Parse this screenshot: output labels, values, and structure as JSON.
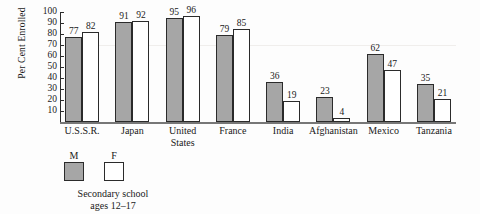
{
  "chart_data": {
    "type": "bar",
    "title": "",
    "xlabel": "",
    "ylabel": "Per Cent Enrolled",
    "ylim": [
      0,
      100
    ],
    "yticks": [
      100,
      90,
      80,
      70,
      60,
      50,
      40,
      30,
      20,
      10
    ],
    "grid": false,
    "legend_position": "below-left",
    "categories": [
      "U.S.S.R.",
      "Japan",
      "United\nStates",
      "France",
      "India",
      "Afghanistan",
      "Mexico",
      "Tanzania"
    ],
    "series": [
      {
        "name": "M",
        "color": "#a6a6a6",
        "values": [
          77,
          91,
          95,
          79,
          36,
          23,
          62,
          35
        ]
      },
      {
        "name": "F",
        "color": "#ffffff",
        "values": [
          82,
          92,
          96,
          85,
          19,
          4,
          47,
          21
        ]
      }
    ],
    "legend": {
      "items": [
        {
          "label": "M",
          "swatch": "filled-gray"
        },
        {
          "label": "F",
          "swatch": "open-white"
        }
      ],
      "caption_line1": "Secondary school",
      "caption_line2": "ages 12–17"
    }
  },
  "colors": {
    "bar_male": "#a6a6a6",
    "bar_female": "#ffffff",
    "outline": "#2b2b2b",
    "background": "#fdfdfd",
    "axis": "#777777"
  }
}
